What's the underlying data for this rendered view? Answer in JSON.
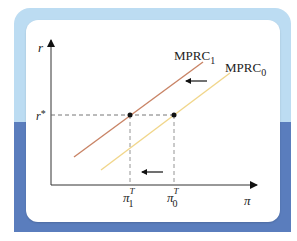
{
  "diagram": {
    "y_axis_label": "r",
    "x_axis_label": "π",
    "r_star_label": "r*",
    "r_star_base": "r",
    "r_star_sup": "*",
    "curves": [
      {
        "name": "MPRC",
        "subscript": "1",
        "color": "#c98466"
      },
      {
        "name": "MPRC",
        "subscript": "0",
        "color": "#f1d68a"
      }
    ],
    "x_ticks": [
      {
        "base": "π",
        "sup": "T",
        "sub": "1"
      },
      {
        "base": "π",
        "sup": "T",
        "sub": "0"
      }
    ],
    "arrows": [
      {
        "direction": "left",
        "meaning": "curve-shift"
      },
      {
        "direction": "left",
        "meaning": "target-inflation-shift"
      }
    ],
    "colors": {
      "frame_light": "#bcdcf2",
      "frame_dark": "#5a7dbd",
      "axis": "#333333",
      "dashed": "#666666"
    }
  }
}
